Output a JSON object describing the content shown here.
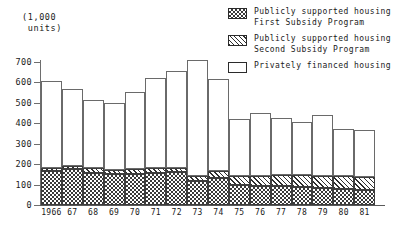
{
  "axis_units_caption": "(1,000\n units)",
  "legend": {
    "position": "top-right",
    "entries": [
      {
        "swatch": "checkerboard-swatch-icon",
        "pattern": "checker",
        "label": "Publicly supported housing\nFirst Subsidy Program"
      },
      {
        "swatch": "diagonal-hatch-swatch-icon",
        "pattern": "hatch",
        "label": "Publicly supported housing\nSecond Subsidy Program"
      },
      {
        "swatch": "plain-white-swatch-icon",
        "pattern": "plain",
        "label": "Privately financed housing"
      }
    ]
  },
  "chart_data": {
    "type": "bar",
    "stacked": true,
    "title": "",
    "subtitle": "",
    "xlabel": "",
    "ylabel": "(1,000 units)",
    "ylim": [
      0,
      700
    ],
    "yticks": [
      0,
      100,
      200,
      300,
      400,
      500,
      600,
      700
    ],
    "ytick_labels": [
      "0",
      "100",
      "200",
      "300",
      "400",
      "500",
      "600",
      "700"
    ],
    "grid": false,
    "legend_position": "top-right",
    "categories": [
      "1966",
      "67",
      "68",
      "69",
      "70",
      "71",
      "72",
      "73",
      "74",
      "75",
      "76",
      "77",
      "78",
      "79",
      "80",
      "81"
    ],
    "series": [
      {
        "name": "Publicly supported housing First Subsidy Program",
        "pattern": "checker",
        "values": [
          165,
          175,
          155,
          150,
          150,
          155,
          160,
          120,
          130,
          100,
          95,
          95,
          90,
          85,
          80,
          75
        ]
      },
      {
        "name": "Publicly supported housing Second Subsidy Program",
        "pattern": "hatch",
        "values": [
          15,
          15,
          25,
          20,
          25,
          25,
          20,
          20,
          35,
          40,
          45,
          50,
          55,
          55,
          60,
          60
        ]
      },
      {
        "name": "Privately financed housing",
        "pattern": "plain",
        "values": [
          425,
          380,
          335,
          330,
          380,
          440,
          475,
          570,
          450,
          280,
          310,
          280,
          260,
          300,
          230,
          230
        ]
      }
    ],
    "totals": [
      605,
      570,
      515,
      500,
      555,
      620,
      655,
      710,
      615,
      420,
      450,
      425,
      405,
      440,
      370,
      365
    ]
  }
}
